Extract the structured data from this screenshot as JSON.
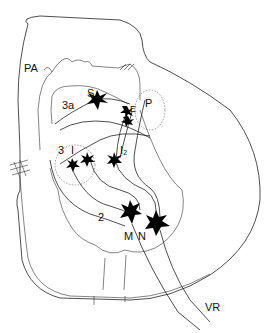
{
  "figure": {
    "type": "neuron-diagram",
    "labels": {
      "PA": "PA",
      "S": "S",
      "3a": "3a",
      "P": "P",
      "E": "E",
      "3": "3",
      "I": "I",
      "I2": "I₂",
      "2": "2",
      "M": "M",
      "N": "N",
      "VR": "VR"
    },
    "colors": {
      "ink": "#111111",
      "background": "#ffffff"
    }
  }
}
